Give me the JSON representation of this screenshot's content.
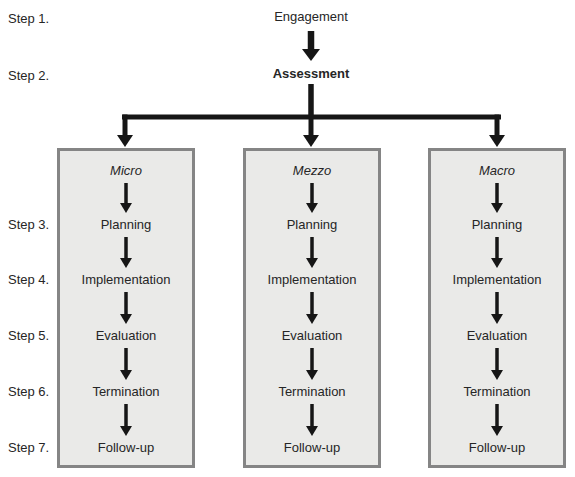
{
  "steps": [
    {
      "label": "Step 1."
    },
    {
      "label": "Step 2."
    },
    {
      "label": "Step 3."
    },
    {
      "label": "Step 4."
    },
    {
      "label": "Step 5."
    },
    {
      "label": "Step 6."
    },
    {
      "label": "Step 7."
    }
  ],
  "nodes": {
    "engagement": "Engagement",
    "assessment": "Assessment"
  },
  "columns": [
    {
      "header": "Micro",
      "rows": [
        "Planning",
        "Implementation",
        "Evaluation",
        "Termination",
        "Follow-up"
      ]
    },
    {
      "header": "Mezzo",
      "rows": [
        "Planning",
        "Implementation",
        "Evaluation",
        "Termination",
        "Follow-up"
      ]
    },
    {
      "header": "Macro",
      "rows": [
        "Planning",
        "Implementation",
        "Evaluation",
        "Termination",
        "Follow-up"
      ]
    }
  ],
  "colors": {
    "box_fill": "#eaeae8",
    "box_border": "#858585",
    "arrow": "#161616",
    "text": "#262626",
    "background": "#ffffff"
  }
}
